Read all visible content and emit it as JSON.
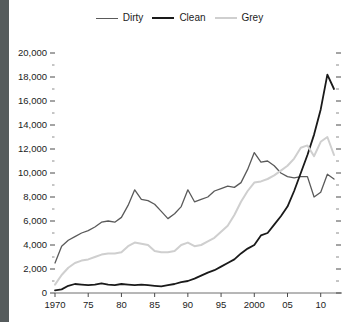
{
  "chart_data": {
    "type": "line",
    "title": "",
    "xlabel": "",
    "ylabel": "",
    "xlim": [
      1970,
      2012
    ],
    "ylim": [
      0,
      20000
    ],
    "grid": false,
    "legend_position": "top-center",
    "y_ticks": [
      "0",
      "2,000",
      "4,000",
      "6,000",
      "8,000",
      "10,000",
      "12,000",
      "14,000",
      "16,000",
      "18,000",
      "20,000"
    ],
    "y_tick_values": [
      0,
      2000,
      4000,
      6000,
      8000,
      10000,
      12000,
      14000,
      16000,
      18000,
      20000
    ],
    "y_minor_step": 1000,
    "x_ticks": [
      "1970",
      "75",
      "80",
      "85",
      "90",
      "95",
      "2000",
      "05",
      "10"
    ],
    "x_tick_values": [
      1970,
      1975,
      1980,
      1985,
      1990,
      1995,
      2000,
      2005,
      2010
    ],
    "x": [
      1970,
      1971,
      1972,
      1973,
      1974,
      1975,
      1976,
      1977,
      1978,
      1979,
      1980,
      1981,
      1982,
      1983,
      1984,
      1985,
      1986,
      1987,
      1988,
      1989,
      1990,
      1991,
      1992,
      1993,
      1994,
      1995,
      1996,
      1997,
      1998,
      1999,
      2000,
      2001,
      2002,
      2003,
      2004,
      2005,
      2006,
      2007,
      2008,
      2009,
      2010,
      2011,
      2012
    ],
    "series": [
      {
        "name": "Dirty",
        "color": "#5a5a5a",
        "width": 1.3,
        "values": [
          2500,
          3900,
          4400,
          4700,
          5000,
          5200,
          5500,
          5900,
          6000,
          5900,
          6300,
          7300,
          8600,
          7800,
          7700,
          7400,
          6800,
          6200,
          6600,
          7200,
          8600,
          7600,
          7800,
          8000,
          8500,
          8700,
          8900,
          8800,
          9200,
          10300,
          11700,
          10900,
          11000,
          10600,
          10000,
          9700,
          9600,
          9700,
          9700,
          8000,
          8400,
          9900,
          9500
        ]
      },
      {
        "name": "Clean",
        "color": "#1a1a1a",
        "width": 1.8,
        "values": [
          220,
          300,
          600,
          750,
          700,
          650,
          700,
          800,
          700,
          650,
          750,
          700,
          650,
          700,
          650,
          600,
          550,
          650,
          750,
          900,
          1000,
          1200,
          1450,
          1700,
          1900,
          2200,
          2500,
          2800,
          3300,
          3700,
          4000,
          4800,
          5000,
          5700,
          6400,
          7200,
          8500,
          10000,
          11500,
          13200,
          15300,
          18200,
          17000
        ]
      },
      {
        "name": "Grey",
        "color": "#cfcfcf",
        "width": 2.0,
        "values": [
          700,
          1500,
          2100,
          2500,
          2700,
          2800,
          3000,
          3200,
          3300,
          3300,
          3400,
          3900,
          4200,
          4100,
          4000,
          3500,
          3400,
          3400,
          3500,
          4000,
          4200,
          3900,
          4000,
          4300,
          4600,
          5100,
          5600,
          6500,
          7600,
          8500,
          9200,
          9300,
          9500,
          9800,
          10200,
          10600,
          11200,
          12100,
          12300,
          11400,
          12600,
          13000,
          11500
        ]
      }
    ]
  },
  "legend": {
    "items": [
      {
        "label": "Dirty",
        "color": "#5a5a5a"
      },
      {
        "label": "Clean",
        "color": "#1a1a1a"
      },
      {
        "label": "Grey",
        "color": "#cfcfcf"
      }
    ]
  }
}
